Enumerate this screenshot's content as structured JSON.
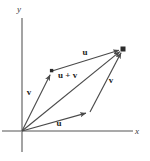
{
  "figure": {
    "caption": "",
    "background_color": "#ffffff",
    "axis_color": "#8c8c8c",
    "vector_color": "#4a4a4a",
    "label_color": "#1c1c1c",
    "width": 150,
    "height": 161
  },
  "axes": {
    "x_label": "x",
    "y_label": "y",
    "origin": {
      "x": 22,
      "y": 131
    },
    "x_axis": {
      "x1": 2,
      "y1": 131,
      "x2": 133,
      "y2": 131
    },
    "y_axis": {
      "x1": 22,
      "y1": 18,
      "x2": 22,
      "y2": 152
    },
    "x_label_pos": {
      "x": 137,
      "y": 134
    },
    "y_label_pos": {
      "x": 19,
      "y": 12
    }
  },
  "chart_data": {
    "type": "diagram",
    "subtype": "vector-parallelogram",
    "title": "",
    "points": {
      "origin": {
        "x": 22,
        "y": 131,
        "label": ""
      },
      "v_tip": {
        "x": 52,
        "y": 71,
        "label": ""
      },
      "u_tip": {
        "x": 90,
        "y": 112,
        "label": ""
      },
      "sum_tip": {
        "x": 123,
        "y": 49,
        "label": ""
      }
    },
    "vectors": [
      {
        "name": "v",
        "label": "v",
        "from": "origin",
        "to": "v_tip",
        "label_pos": {
          "x": 29,
          "y": 95
        },
        "arrow": true
      },
      {
        "name": "u",
        "label": "u",
        "from": "origin",
        "to": "u_tip",
        "label_pos": {
          "x": 59,
          "y": 126
        },
        "arrow": true
      },
      {
        "name": "u_top",
        "label": "u",
        "from": "v_tip",
        "to": "sum_tip",
        "label_pos": {
          "x": 85,
          "y": 55
        },
        "arrow": true
      },
      {
        "name": "v_right",
        "label": "v",
        "from": "u_tip",
        "to": "sum_tip",
        "label_pos": {
          "x": 111,
          "y": 83
        },
        "arrow": true
      },
      {
        "name": "u_plus_v",
        "label": "u + v",
        "from": "origin",
        "to": "sum_tip",
        "label_pos": {
          "x": 58,
          "y": 78
        },
        "arrow": true
      }
    ],
    "markers": [
      {
        "at": "sum_tip",
        "shape": "filled-square",
        "size": 5
      }
    ]
  }
}
